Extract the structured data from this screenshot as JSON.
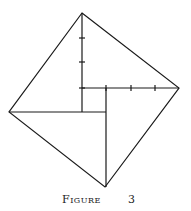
{
  "figure": {
    "caption_word": "Figure",
    "caption_number": "3",
    "stroke_color": "#1a1a1a",
    "outer_square": {
      "vertices": [
        [
          82,
          13
        ],
        [
          179,
          88
        ],
        [
          105,
          187
        ],
        [
          9,
          112
        ]
      ]
    },
    "inner_square": {
      "x1": 82,
      "y1": 88,
      "x2": 106,
      "y2": 112
    },
    "segments": [
      {
        "name": "vertical-segment-top",
        "x1": 82,
        "y1": 13,
        "x2": 82,
        "y2": 112
      },
      {
        "name": "horizontal-segment-right",
        "x1": 82,
        "y1": 88,
        "x2": 179,
        "y2": 88
      },
      {
        "name": "horizontal-segment-left",
        "x1": 9,
        "y1": 112,
        "x2": 106,
        "y2": 112
      },
      {
        "name": "vertical-segment-bottom",
        "x1": 106,
        "y1": 88,
        "x2": 106,
        "y2": 187
      }
    ],
    "ticks_vertical_y": [
      38,
      62,
      88
    ],
    "ticks_horizontal_x": [
      106,
      131,
      155
    ]
  }
}
